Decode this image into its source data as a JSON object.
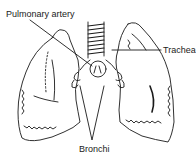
{
  "diagram": {
    "labels": {
      "pulmonary_artery": "Pulmonary artery",
      "trachea": "Trachea",
      "bronchi": "Bronchi"
    },
    "colors": {
      "background": "#ffffff",
      "ink": "#1a1a1a"
    }
  }
}
